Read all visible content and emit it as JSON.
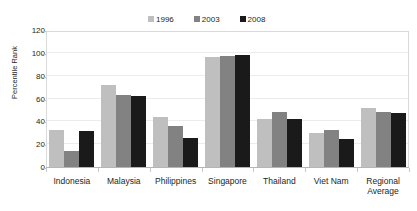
{
  "chart_data": {
    "type": "bar",
    "title": "",
    "subtitle": "",
    "xlabel": "",
    "ylabel": "Percentile Rank",
    "ylim": [
      0,
      120
    ],
    "yticks": [
      0,
      20,
      40,
      60,
      80,
      100,
      120
    ],
    "grid": true,
    "legend_position": "top-center",
    "categories": [
      "Indonesia",
      "Malaysia",
      "Philippines",
      "Singapore",
      "Thailand",
      "Viet Nam",
      "Regional Average"
    ],
    "category_lines": [
      [
        "Indonesia"
      ],
      [
        "Malaysia"
      ],
      [
        "Philippines"
      ],
      [
        "Singapore"
      ],
      [
        "Thailand"
      ],
      [
        "Viet Nam"
      ],
      [
        "Regional",
        "Average"
      ]
    ],
    "series": [
      {
        "name": "1996",
        "color": "#bfbfbf",
        "values": [
          33,
          73,
          45,
          97,
          43,
          31,
          53
        ]
      },
      {
        "name": "2003",
        "color": "#828282",
        "values": [
          15,
          64,
          37,
          98.5,
          49,
          33,
          49
        ]
      },
      {
        "name": "2008",
        "color": "#1a1a1a",
        "values": [
          32,
          63,
          26,
          99,
          43,
          25,
          48
        ]
      }
    ]
  },
  "colors": {
    "series_1996": "#bfbfbf",
    "series_2003": "#828282",
    "series_2008": "#1a1a1a",
    "frame": "#d9d9d9",
    "gridline": "#ececec",
    "axis": "#b5b5b5",
    "text": "#231f20",
    "background": "#ffffff"
  }
}
